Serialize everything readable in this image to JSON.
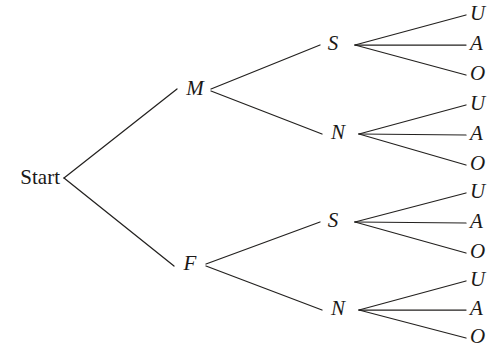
{
  "diagram": {
    "type": "tree-diagram",
    "background_color": "#ffffff",
    "line_color": "#23211f",
    "text_color": "#1b1917",
    "root": {
      "label": "Start",
      "style": "roman",
      "x": 60,
      "y": 178
    },
    "levels": [
      {
        "name": "gender",
        "nodes": [
          {
            "label": "M",
            "x": 195,
            "y": 90
          },
          {
            "label": "F",
            "x": 190,
            "y": 265
          }
        ]
      },
      {
        "name": "status",
        "nodes": [
          {
            "label": "S",
            "x": 333,
            "y": 45,
            "parent": "M"
          },
          {
            "label": "N",
            "x": 337,
            "y": 134,
            "parent": "M"
          },
          {
            "label": "S",
            "x": 333,
            "y": 222,
            "parent": "F"
          },
          {
            "label": "N",
            "x": 337,
            "y": 310,
            "parent": "F"
          }
        ]
      },
      {
        "name": "outcome",
        "nodes": [
          {
            "label": "U",
            "x": 470,
            "y": 15,
            "parent": "M-S"
          },
          {
            "label": "A",
            "x": 470,
            "y": 45,
            "parent": "M-S"
          },
          {
            "label": "O",
            "x": 470,
            "y": 75,
            "parent": "M-S"
          },
          {
            "label": "U",
            "x": 470,
            "y": 105,
            "parent": "M-N"
          },
          {
            "label": "A",
            "x": 470,
            "y": 135,
            "parent": "M-N"
          },
          {
            "label": "O",
            "x": 470,
            "y": 165,
            "parent": "M-N"
          },
          {
            "label": "U",
            "x": 470,
            "y": 193,
            "parent": "F-S"
          },
          {
            "label": "A",
            "x": 470,
            "y": 223,
            "parent": "F-S"
          },
          {
            "label": "O",
            "x": 470,
            "y": 253,
            "parent": "F-S"
          },
          {
            "label": "U",
            "x": 470,
            "y": 281,
            "parent": "F-N"
          },
          {
            "label": "A",
            "x": 470,
            "y": 310,
            "parent": "F-N"
          },
          {
            "label": "O",
            "x": 470,
            "y": 338,
            "parent": "F-N"
          }
        ]
      }
    ],
    "edges": [
      {
        "name": "start-to-m",
        "x1": 64,
        "y1": 178,
        "x2": 177,
        "y2": 89
      },
      {
        "name": "start-to-f",
        "x1": 64,
        "y1": 178,
        "x2": 174,
        "y2": 266
      },
      {
        "name": "m-to-s",
        "x1": 211,
        "y1": 89,
        "x2": 320,
        "y2": 45
      },
      {
        "name": "m-to-n",
        "x1": 211,
        "y1": 91,
        "x2": 322,
        "y2": 134
      },
      {
        "name": "f-to-s",
        "x1": 206,
        "y1": 264,
        "x2": 320,
        "y2": 222
      },
      {
        "name": "f-to-n",
        "x1": 206,
        "y1": 266,
        "x2": 322,
        "y2": 310
      },
      {
        "name": "ms-to-u",
        "x1": 355,
        "y1": 45,
        "x2": 466,
        "y2": 15
      },
      {
        "name": "ms-to-a",
        "x1": 355,
        "y1": 45,
        "x2": 466,
        "y2": 45
      },
      {
        "name": "ms-to-o",
        "x1": 355,
        "y1": 45,
        "x2": 466,
        "y2": 75
      },
      {
        "name": "mn-to-u",
        "x1": 359,
        "y1": 134,
        "x2": 466,
        "y2": 105
      },
      {
        "name": "mn-to-a",
        "x1": 359,
        "y1": 134,
        "x2": 466,
        "y2": 135
      },
      {
        "name": "mn-to-o",
        "x1": 359,
        "y1": 134,
        "x2": 466,
        "y2": 165
      },
      {
        "name": "fs-to-u",
        "x1": 355,
        "y1": 222,
        "x2": 466,
        "y2": 193
      },
      {
        "name": "fs-to-a",
        "x1": 355,
        "y1": 222,
        "x2": 466,
        "y2": 223
      },
      {
        "name": "fs-to-o",
        "x1": 355,
        "y1": 222,
        "x2": 466,
        "y2": 253
      },
      {
        "name": "fn-to-u",
        "x1": 359,
        "y1": 310,
        "x2": 466,
        "y2": 281
      },
      {
        "name": "fn-to-a",
        "x1": 359,
        "y1": 310,
        "x2": 466,
        "y2": 310
      },
      {
        "name": "fn-to-o",
        "x1": 359,
        "y1": 310,
        "x2": 466,
        "y2": 338
      }
    ]
  }
}
